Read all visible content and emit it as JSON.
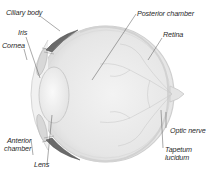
{
  "colors": {
    "background": "#ffffff",
    "eye_fill": "#ebebeb",
    "eye_outline": "#c9c9c9",
    "lens_fill": "#f4f4f4",
    "ciliary_dark": "#5a5a5a",
    "leader_line": "#555555",
    "label_text": "#2a2a2a"
  },
  "labels": [
    {
      "id": "ciliary-body",
      "text": "Ciliary body"
    },
    {
      "id": "iris",
      "text": "Iris"
    },
    {
      "id": "cornea",
      "text": "Cornea"
    },
    {
      "id": "posterior-chamber",
      "text": "Posterior chamber"
    },
    {
      "id": "retina",
      "text": "Retina"
    },
    {
      "id": "anterior-chamber",
      "text_line1": "Anterior",
      "text_line2": "chamber"
    },
    {
      "id": "lens",
      "text": "Lens"
    },
    {
      "id": "optic-nerve",
      "text": "Optic nerve"
    },
    {
      "id": "tapetum-lucidum",
      "text_line1": "Tapetum",
      "text_line2": "lucidum"
    }
  ]
}
